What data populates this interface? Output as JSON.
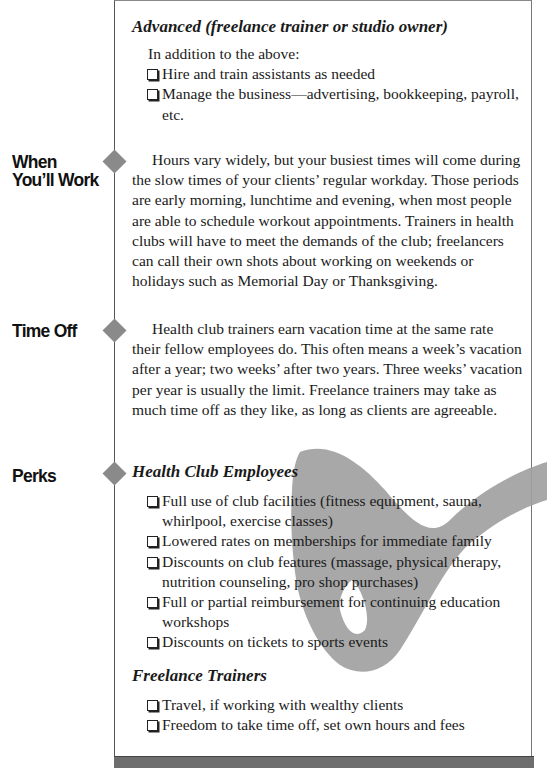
{
  "advanced": {
    "heading": "Advanced (freelance trainer or studio owner)",
    "intro": "In addition to the above:",
    "items": [
      "Hire and train assistants as needed",
      "Manage the business—advertising, bookkeeping, payroll, etc."
    ]
  },
  "sections": {
    "when": {
      "label_line1": "When",
      "label_line2": "You’ll Work",
      "body": "Hours vary widely, but your busiest times will come during the slow times of your clients’ regular workday. Those periods are early morning, lunchtime and evening, when most people are able to schedule workout appointments. Trainers in health clubs will have to meet the demands of the club; freelancers can call their own shots about working on weekends or holidays such as Memorial Day or Thanksgiving."
    },
    "timeoff": {
      "label": "Time Off",
      "body": "Health club trainers earn vacation time at the same rate their fellow employees do. This often means a week’s vacation after a year; two weeks’ after two years. Three weeks’ vacation per year is usually the limit. Freelance trainers may take as much time off as they like, as long as clients are agreeable."
    },
    "perks": {
      "label": "Perks",
      "health_club": {
        "heading": "Health Club Employees",
        "items": [
          "Full use of club facilities (fitness equipment, sauna, whirlpool, exercise classes)",
          "Lowered rates on memberships for immediate family",
          "Discounts on club features (massage, physical therapy, nutrition counseling, pro shop purchases)",
          "Full or partial reimbursement for continuing education workshops",
          "Discounts on tickets to sports events"
        ]
      },
      "freelance": {
        "heading": "Freelance Trainers",
        "items": [
          "Travel, if working with wealthy clients",
          "Freedom to take time off, set own hours and fees"
        ]
      }
    }
  },
  "colors": {
    "diamond": "#8a8a8a",
    "swoosh": "#a0a0a0",
    "bottom_bar": "#6e6e6e"
  }
}
